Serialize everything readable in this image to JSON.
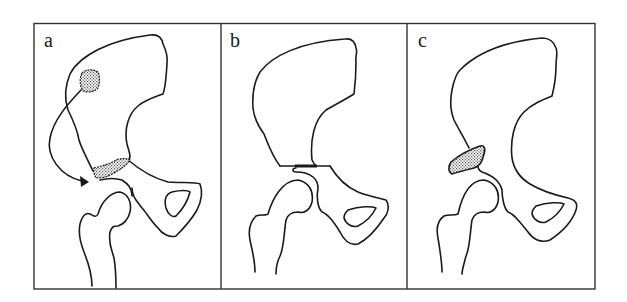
{
  "figure": {
    "panels": [
      {
        "id": "a",
        "label": "a",
        "content": "Ilium with stippled donor graft site on iliac wing; curved arrow indicating transfer of graft to stippled site above femoral head"
      },
      {
        "id": "b",
        "label": "b",
        "content": "Ilium osteotomy line above the acetabulum, shown as a thick horizontal cut"
      },
      {
        "id": "c",
        "label": "c",
        "content": "Stippled bone graft block placed above the femoral head (shelf)"
      }
    ]
  },
  "colors": {
    "line": "#1a1a1a",
    "frame": "#333333",
    "background": "#ffffff",
    "stipple": "#8a8a8a"
  }
}
